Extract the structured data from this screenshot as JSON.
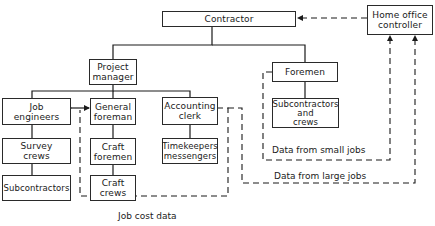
{
  "diagram": {
    "type": "organization-chart",
    "nodes": [
      {
        "id": "contractor",
        "label": "Contractor"
      },
      {
        "id": "home_office_controller",
        "label": "Home office\ncontroller"
      },
      {
        "id": "project_manager",
        "label": "Project\nmanager"
      },
      {
        "id": "foremen",
        "label": "Foremen"
      },
      {
        "id": "job_engineers",
        "label": "Job\nengineers"
      },
      {
        "id": "general_foreman",
        "label": "General\nforeman"
      },
      {
        "id": "accounting_clerk",
        "label": "Accounting\nclerk"
      },
      {
        "id": "subcontractors_and_crews",
        "label": "Subcontractors\nand\ncrews"
      },
      {
        "id": "survey_crews",
        "label": "Survey\ncrews"
      },
      {
        "id": "craft_foremen",
        "label": "Craft\nforemen"
      },
      {
        "id": "timekeepers_messengers",
        "label": "Timekeepers\nmessengers"
      },
      {
        "id": "subcontractors",
        "label": "Subcontractors"
      },
      {
        "id": "craft_crews",
        "label": "Craft\ncrews"
      }
    ],
    "edges": [
      {
        "from": "contractor",
        "to": "project_manager",
        "style": "solid"
      },
      {
        "from": "contractor",
        "to": "foremen",
        "style": "solid"
      },
      {
        "from": "project_manager",
        "to": "job_engineers",
        "style": "solid"
      },
      {
        "from": "project_manager",
        "to": "general_foreman",
        "style": "solid"
      },
      {
        "from": "project_manager",
        "to": "accounting_clerk",
        "style": "solid"
      },
      {
        "from": "job_engineers",
        "to": "survey_crews",
        "style": "solid"
      },
      {
        "from": "survey_crews",
        "to": "subcontractors",
        "style": "solid"
      },
      {
        "from": "general_foreman",
        "to": "craft_foremen",
        "style": "solid"
      },
      {
        "from": "craft_foremen",
        "to": "craft_crews",
        "style": "solid"
      },
      {
        "from": "accounting_clerk",
        "to": "timekeepers_messengers",
        "style": "solid"
      },
      {
        "from": "foremen",
        "to": "subcontractors_and_crews",
        "style": "solid"
      },
      {
        "from": "job_engineers",
        "to": "general_foreman",
        "style": "solid",
        "arrow": "both"
      },
      {
        "from": "home_office_controller",
        "to": "contractor",
        "style": "dashed",
        "arrow": "end"
      },
      {
        "from": "accounting_clerk",
        "to": "job_engineers",
        "style": "dashed",
        "arrow": "end",
        "label": "Job cost data"
      },
      {
        "from": "foremen",
        "to": "home_office_controller",
        "style": "dashed",
        "arrow": "end",
        "label": "Data from small jobs"
      },
      {
        "from": "accounting_clerk",
        "to": "home_office_controller",
        "style": "dashed",
        "arrow": "end",
        "label": "Data from large jobs"
      }
    ],
    "flow_labels": {
      "job_cost_data": "Job cost data",
      "small_jobs": "Data from small jobs",
      "large_jobs": "Data from large jobs"
    }
  }
}
